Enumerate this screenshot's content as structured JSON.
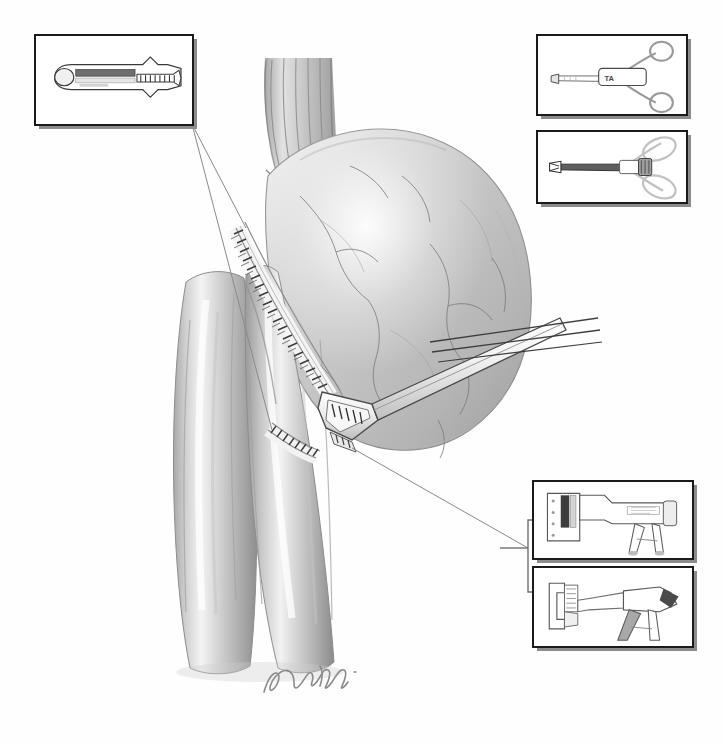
{
  "figure": {
    "domain": "medical-illustration",
    "medium": "graphite pencil rendering, grayscale",
    "background_color": "#ffffff",
    "ink_color": "#1a1a1a",
    "tissue_color": "#c9c9c9",
    "signature": "Nobashi"
  },
  "anatomy": {
    "esophagus": {
      "name": "esophagus",
      "description": "tubular segment with longitudinal mucosal folds entering from above",
      "fold_count": 6
    },
    "stomach": {
      "name": "stomach",
      "description": "large rounded gastric body with serosal vascular markings"
    },
    "bowel_limbs": {
      "name": "jejunal-limbs",
      "description": "two parallel small-bowel limbs descending below the anastomosis",
      "count": 2
    },
    "staple_lines": [
      {
        "name": "primary-staple-line",
        "description": "long double row of staples along the anastomosis"
      },
      {
        "name": "secondary-staple-line",
        "description": "short staple row at the inferior enterotomy closure"
      }
    ],
    "anastomosis": {
      "name": "side-to-side-anastomosis",
      "description": "stapler jaw inserted at the junction of stomach and bowel limb"
    }
  },
  "instrument_in_field": {
    "name": "linear-cutting-stapler",
    "description": "shaft entering from upper right with jaw seated at the anastomosis"
  },
  "insets": [
    {
      "id": "top-left",
      "name": "staple-cartridge-detail",
      "label": "staple cartridge and anvil detail",
      "contents": "close view of the loaded linear cartridge with staggered staple rows"
    },
    {
      "id": "top-right-1",
      "name": "ring-handle-stapler",
      "label": "ring-handled linear stapler",
      "contents": "scissor-style ring handles with straight shaft and marked body",
      "body_marking": "TA"
    },
    {
      "id": "top-right-2",
      "name": "ring-handle-grasper",
      "label": "ring-handled grasping forceps",
      "contents": "long shaft instrument with ring handles and blunt jaw"
    },
    {
      "id": "bottom-right-1",
      "name": "pistol-grip-linear-stapler",
      "label": "pistol-grip linear stapler",
      "contents": "pistol-grip handle with straight jaw and loaded cartridge"
    },
    {
      "id": "bottom-right-2",
      "name": "pistol-grip-stapler-open-jaw",
      "label": "pistol-grip linear stapler, jaw open",
      "contents": "same stapler shown with the jaw opened and trigger lever extended"
    }
  ],
  "leaders": [
    {
      "name": "leader-cartridge-upper",
      "from": "top-left-inset",
      "to": "primary-staple-line"
    },
    {
      "name": "leader-cartridge-lower",
      "from": "top-left-inset",
      "to": "secondary-staple-line"
    },
    {
      "name": "leader-stapler-bracket",
      "from": "bottom-right-insets",
      "to": "stapler-jaw"
    }
  ]
}
